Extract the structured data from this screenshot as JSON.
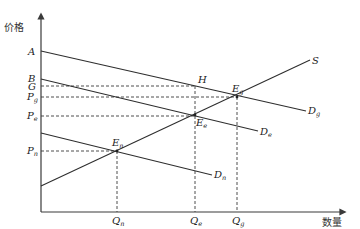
{
  "diagram": {
    "type": "supply-demand",
    "axes": {
      "y_label": "价格",
      "x_label": "数量"
    },
    "y_ticks": [
      {
        "label": "A",
        "sub": ""
      },
      {
        "label": "B",
        "sub": ""
      },
      {
        "label": "G",
        "sub": ""
      },
      {
        "label": "P",
        "sub": "g"
      },
      {
        "label": "P",
        "sub": "e"
      },
      {
        "label": "P",
        "sub": "n"
      }
    ],
    "x_ticks": [
      {
        "label": "Q",
        "sub": "n"
      },
      {
        "label": "Q",
        "sub": "e"
      },
      {
        "label": "Q",
        "sub": "g"
      }
    ],
    "curves": [
      {
        "label": "S",
        "sub": ""
      },
      {
        "label": "D",
        "sub": "g"
      },
      {
        "label": "D",
        "sub": "e"
      },
      {
        "label": "D",
        "sub": "n"
      }
    ],
    "points": [
      {
        "label": "H",
        "sub": ""
      },
      {
        "label": "E",
        "sub": "g"
      },
      {
        "label": "E",
        "sub": "e"
      },
      {
        "label": "E",
        "sub": "n"
      }
    ]
  }
}
